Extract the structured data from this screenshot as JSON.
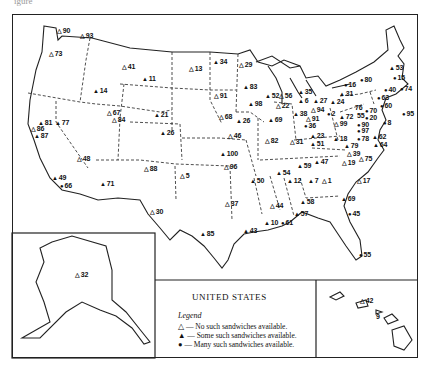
{
  "caption_fragment": "igure",
  "title": "UNITED STATES",
  "legend": {
    "heading": "Legend",
    "items": [
      {
        "symbol": "△",
        "label": "— No such sandwiches available."
      },
      {
        "symbol": "▲",
        "label": "— Some such sandwiches available."
      },
      {
        "symbol": "●",
        "label": "— Many such sandwiches available."
      }
    ]
  },
  "markers": [
    {
      "id": "m90",
      "num": "90",
      "sym": "△",
      "x": 57,
      "y": 31
    },
    {
      "id": "m93",
      "num": "93",
      "sym": "△",
      "x": 80,
      "y": 36
    },
    {
      "id": "m73",
      "num": "73",
      "sym": "△",
      "x": 49,
      "y": 54
    },
    {
      "id": "m41",
      "num": "41",
      "sym": "△",
      "x": 122,
      "y": 67
    },
    {
      "id": "m11",
      "num": "11",
      "sym": "▲",
      "x": 142,
      "y": 79
    },
    {
      "id": "m13",
      "num": "13",
      "sym": "△",
      "x": 189,
      "y": 69
    },
    {
      "id": "m34",
      "num": "34",
      "sym": "▲",
      "x": 213,
      "y": 62
    },
    {
      "id": "m29",
      "num": "29",
      "sym": "△",
      "x": 239,
      "y": 65
    },
    {
      "id": "m14",
      "num": "14",
      "sym": "▲",
      "x": 93,
      "y": 91
    },
    {
      "id": "m83",
      "num": "83",
      "sym": "▲",
      "x": 243,
      "y": 87
    },
    {
      "id": "m91w",
      "num": "91",
      "sym": "△",
      "x": 214,
      "y": 96
    },
    {
      "id": "m52",
      "num": "52",
      "sym": "▲",
      "x": 265,
      "y": 96
    },
    {
      "id": "m56",
      "num": "56",
      "sym": "△",
      "x": 279,
      "y": 96
    },
    {
      "id": "m35",
      "num": "35",
      "sym": "▲",
      "x": 298,
      "y": 92
    },
    {
      "id": "m67",
      "num": "67",
      "sym": "△",
      "x": 107,
      "y": 113
    },
    {
      "id": "m84",
      "num": "84",
      "sym": "△",
      "x": 112,
      "y": 120
    },
    {
      "id": "m21",
      "num": "21",
      "sym": "▲",
      "x": 154,
      "y": 115
    },
    {
      "id": "m98",
      "num": "98",
      "sym": "▲",
      "x": 248,
      "y": 104
    },
    {
      "id": "m22",
      "num": "22",
      "sym": "△",
      "x": 276,
      "y": 106
    },
    {
      "id": "m6",
      "num": "6",
      "sym": "▲",
      "x": 298,
      "y": 101
    },
    {
      "id": "m27",
      "num": "27",
      "sym": "▲",
      "x": 313,
      "y": 101
    },
    {
      "id": "m24",
      "num": "24",
      "sym": "▲",
      "x": 330,
      "y": 102
    },
    {
      "id": "m31n",
      "num": "31",
      "sym": "▲",
      "x": 339,
      "y": 94
    },
    {
      "id": "m16",
      "num": "16",
      "sym": "●",
      "x": 344,
      "y": 85
    },
    {
      "id": "m80",
      "num": "80",
      "sym": "●",
      "x": 360,
      "y": 80
    },
    {
      "id": "m53",
      "num": "53",
      "sym": "▲",
      "x": 389,
      "y": 68
    },
    {
      "id": "m15",
      "num": "15",
      "sym": "●",
      "x": 393,
      "y": 78
    },
    {
      "id": "m40",
      "num": "40",
      "sym": "●",
      "x": 384,
      "y": 90
    },
    {
      "id": "m74",
      "num": "74",
      "sym": "●",
      "x": 400,
      "y": 89
    },
    {
      "id": "m63",
      "num": "63",
      "sym": "●",
      "x": 377,
      "y": 98
    },
    {
      "id": "m60",
      "num": "60",
      "sym": "●",
      "x": 380,
      "y": 106
    },
    {
      "id": "m95",
      "num": "95",
      "sym": "●",
      "x": 402,
      "y": 114
    },
    {
      "id": "m68",
      "num": "68",
      "sym": "△",
      "x": 219,
      "y": 117
    },
    {
      "id": "m26n",
      "num": "26",
      "sym": "▲",
      "x": 236,
      "y": 121
    },
    {
      "id": "m69",
      "num": "69",
      "sym": "▲",
      "x": 268,
      "y": 120
    },
    {
      "id": "m38",
      "num": "38",
      "sym": "▲",
      "x": 293,
      "y": 114
    },
    {
      "id": "m94",
      "num": "94",
      "sym": "△",
      "x": 311,
      "y": 110
    },
    {
      "id": "m2",
      "num": "2",
      "sym": "●",
      "x": 327,
      "y": 114
    },
    {
      "id": "m91e",
      "num": "91",
      "sym": "△",
      "x": 306,
      "y": 119
    },
    {
      "id": "m72",
      "num": "72",
      "sym": "▲",
      "x": 339,
      "y": 117
    },
    {
      "id": "m76",
      "num": "76",
      "sym": "",
      "x": 355,
      "y": 108
    },
    {
      "id": "m70",
      "num": "70",
      "sym": "●",
      "x": 365,
      "y": 111
    },
    {
      "id": "m55ne",
      "num": "55",
      "sym": "",
      "x": 357,
      "y": 116
    },
    {
      "id": "m20",
      "num": "20",
      "sym": "●",
      "x": 365,
      "y": 118
    },
    {
      "id": "m99",
      "num": "99",
      "sym": "△",
      "x": 334,
      "y": 124
    },
    {
      "id": "m36",
      "num": "36",
      "sym": "●",
      "x": 304,
      "y": 126
    },
    {
      "id": "m90e",
      "num": "90",
      "sym": "●",
      "x": 357,
      "y": 125
    },
    {
      "id": "m8",
      "num": "8",
      "sym": "●",
      "x": 383,
      "y": 123
    },
    {
      "id": "m97",
      "num": "97",
      "sym": "●",
      "x": 357,
      "y": 131
    },
    {
      "id": "m23",
      "num": "23",
      "sym": "▲",
      "x": 310,
      "y": 136
    },
    {
      "id": "m78",
      "num": "78",
      "sym": "●",
      "x": 357,
      "y": 139
    },
    {
      "id": "m62",
      "num": "62",
      "sym": "▲",
      "x": 372,
      "y": 137
    },
    {
      "id": "m64",
      "num": "64",
      "sym": "▲",
      "x": 373,
      "y": 145
    },
    {
      "id": "m81",
      "num": "81",
      "sym": "▲",
      "x": 38,
      "y": 123
    },
    {
      "id": "m77",
      "num": "77",
      "sym": "▲",
      "x": 55,
      "y": 123
    },
    {
      "id": "m86",
      "num": "86",
      "sym": "△",
      "x": 31,
      "y": 129
    },
    {
      "id": "m87",
      "num": "87",
      "sym": "▲",
      "x": 34,
      "y": 136
    },
    {
      "id": "m26w",
      "num": "26",
      "sym": "▲",
      "x": 160,
      "y": 133
    },
    {
      "id": "m46",
      "num": "46",
      "sym": "△",
      "x": 228,
      "y": 136
    },
    {
      "id": "m82",
      "num": "82",
      "sym": "△",
      "x": 265,
      "y": 141
    },
    {
      "id": "m31m",
      "num": "31",
      "sym": "△",
      "x": 290,
      "y": 142
    },
    {
      "id": "m51",
      "num": "51",
      "sym": "▲",
      "x": 310,
      "y": 144
    },
    {
      "id": "m18",
      "num": "18",
      "sym": "▲",
      "x": 333,
      "y": 139
    },
    {
      "id": "m79",
      "num": "79",
      "sym": "▲",
      "x": 344,
      "y": 146
    },
    {
      "id": "m39",
      "num": "39",
      "sym": "△",
      "x": 347,
      "y": 154
    },
    {
      "id": "m19",
      "num": "19",
      "sym": "△",
      "x": 342,
      "y": 163
    },
    {
      "id": "m75",
      "num": "75",
      "sym": "△",
      "x": 359,
      "y": 159
    },
    {
      "id": "m48",
      "num": "48",
      "sym": "△",
      "x": 77,
      "y": 159
    },
    {
      "id": "m88",
      "num": "88",
      "sym": "△",
      "x": 144,
      "y": 169
    },
    {
      "id": "m100",
      "num": "100",
      "sym": "▲",
      "x": 220,
      "y": 154
    },
    {
      "id": "m96",
      "num": "96",
      "sym": "△",
      "x": 224,
      "y": 167
    },
    {
      "id": "m47",
      "num": "47",
      "sym": "▲",
      "x": 314,
      "y": 162
    },
    {
      "id": "m59",
      "num": "59",
      "sym": "▲",
      "x": 297,
      "y": 166
    },
    {
      "id": "m54",
      "num": "54",
      "sym": "▲",
      "x": 276,
      "y": 173
    },
    {
      "id": "m5",
      "num": "5",
      "sym": "△",
      "x": 180,
      "y": 176
    },
    {
      "id": "m50",
      "num": "50",
      "sym": "▲",
      "x": 250,
      "y": 181
    },
    {
      "id": "m12",
      "num": "12",
      "sym": "▲",
      "x": 287,
      "y": 181
    },
    {
      "id": "m7",
      "num": "7",
      "sym": "▲",
      "x": 308,
      "y": 181
    },
    {
      "id": "m1",
      "num": "1",
      "sym": "△",
      "x": 322,
      "y": 181
    },
    {
      "id": "m17",
      "num": "17",
      "sym": "△",
      "x": 357,
      "y": 181
    },
    {
      "id": "m49",
      "num": "49",
      "sym": "▲",
      "x": 52,
      "y": 178
    },
    {
      "id": "m66",
      "num": "66",
      "sym": "●",
      "x": 60,
      "y": 186
    },
    {
      "id": "m71",
      "num": "71",
      "sym": "▲",
      "x": 100,
      "y": 184
    },
    {
      "id": "m37",
      "num": "37",
      "sym": "△",
      "x": 225,
      "y": 204
    },
    {
      "id": "m44",
      "num": "44",
      "sym": "△",
      "x": 270,
      "y": 206
    },
    {
      "id": "m58",
      "num": "58",
      "sym": "▲",
      "x": 300,
      "y": 202
    },
    {
      "id": "m69s",
      "num": "69",
      "sym": "▲",
      "x": 341,
      "y": 199
    },
    {
      "id": "m30",
      "num": "30",
      "sym": "△",
      "x": 150,
      "y": 212
    },
    {
      "id": "m57",
      "num": "57",
      "sym": "▲",
      "x": 294,
      "y": 214
    },
    {
      "id": "m45",
      "num": "45",
      "sym": "●",
      "x": 348,
      "y": 214
    },
    {
      "id": "m10",
      "num": "10",
      "sym": "▲",
      "x": 264,
      "y": 223
    },
    {
      "id": "m61",
      "num": "61",
      "sym": "●",
      "x": 281,
      "y": 223
    },
    {
      "id": "m43",
      "num": "43",
      "sym": "▲",
      "x": 243,
      "y": 231
    },
    {
      "id": "m85",
      "num": "85",
      "sym": "▲",
      "x": 200,
      "y": 234
    },
    {
      "id": "m55s",
      "num": "55",
      "sym": "●",
      "x": 359,
      "y": 255
    },
    {
      "id": "m32",
      "num": "32",
      "sym": "△",
      "x": 75,
      "y": 275
    },
    {
      "id": "m42",
      "num": "42",
      "sym": "△",
      "x": 360,
      "y": 301
    },
    {
      "id": "m9",
      "num": "9",
      "sym": "",
      "x": 376,
      "y": 317
    }
  ]
}
